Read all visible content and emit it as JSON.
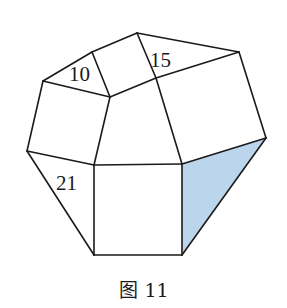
{
  "figure": {
    "caption": "图 11",
    "shaded_color": "#BBD6EC",
    "line_color": "#1a1a1a",
    "labels": [
      {
        "text": "10",
        "x": 69,
        "y": 81
      },
      {
        "text": "15",
        "x": 150,
        "y": 67
      },
      {
        "text": "21",
        "x": 56,
        "y": 190
      }
    ],
    "vertices": {
      "A": [
        137,
        33
      ],
      "B": [
        92,
        52
      ],
      "C": [
        43,
        81
      ],
      "D": [
        110,
        97
      ],
      "E": [
        156,
        78
      ],
      "F": [
        239,
        52
      ],
      "G": [
        266,
        138
      ],
      "H": [
        27,
        151
      ],
      "I": [
        94,
        165
      ],
      "J": [
        182,
        164
      ],
      "K": [
        94,
        255
      ],
      "L": [
        182,
        255
      ]
    },
    "edges": [
      [
        "A",
        "B"
      ],
      [
        "B",
        "C"
      ],
      [
        "C",
        "D"
      ],
      [
        "B",
        "D"
      ],
      [
        "A",
        "E"
      ],
      [
        "A",
        "F"
      ],
      [
        "E",
        "F"
      ],
      [
        "D",
        "E"
      ],
      [
        "C",
        "H"
      ],
      [
        "D",
        "I"
      ],
      [
        "E",
        "J"
      ],
      [
        "F",
        "G"
      ],
      [
        "H",
        "I"
      ],
      [
        "I",
        "J"
      ],
      [
        "G",
        "J"
      ],
      [
        "H",
        "K"
      ],
      [
        "I",
        "K"
      ],
      [
        "K",
        "L"
      ],
      [
        "J",
        "L"
      ],
      [
        "G",
        "L"
      ]
    ],
    "shaded_face": [
      "J",
      "G",
      "L"
    ]
  }
}
